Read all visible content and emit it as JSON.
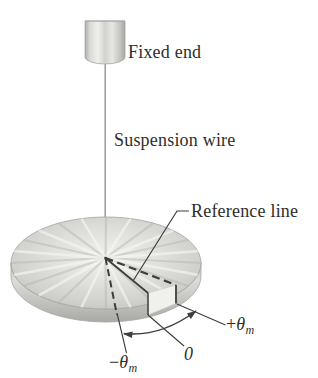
{
  "figure": {
    "labels": {
      "fixed_end": "Fixed end",
      "suspension_wire": "Suspension wire",
      "reference_line": "Reference line",
      "angle_zero": "0",
      "angle_plus": {
        "sign": "+",
        "symbol": "θ",
        "subscript": "m"
      },
      "angle_minus": {
        "sign": "−",
        "symbol": "θ",
        "subscript": "m"
      }
    },
    "colors": {
      "background": "#ffffff",
      "line": "#3e3e3c",
      "text": "#2e2e2c",
      "wire": "#9a9a98",
      "metal_light": "#efefed",
      "metal_mid": "#d6d6d2",
      "metal_dark": "#aeaeaa"
    }
  }
}
